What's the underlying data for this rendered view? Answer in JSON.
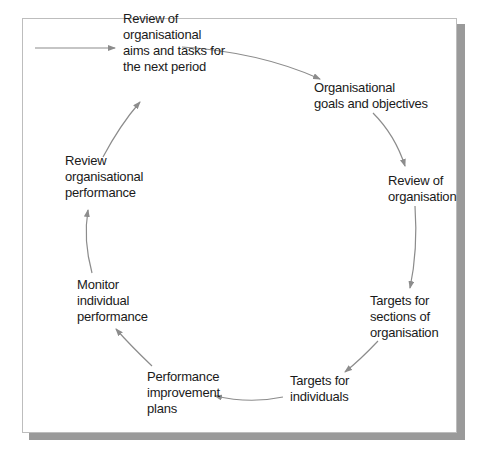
{
  "diagram": {
    "type": "cycle",
    "entry_arrow": true,
    "arrow_color": "#8c8c8c",
    "shadow_color": "#9a9a9a",
    "nodes": [
      {
        "id": "review-aims",
        "lines": [
          "Review of",
          "organisational",
          "aims and tasks for",
          "the next period"
        ]
      },
      {
        "id": "goals-objectives",
        "lines": [
          "Organisational",
          "goals and objectives"
        ]
      },
      {
        "id": "review-organisation",
        "lines": [
          "Review of",
          "organisation"
        ]
      },
      {
        "id": "targets-sections",
        "lines": [
          "Targets for",
          "sections of",
          "organisation"
        ]
      },
      {
        "id": "targets-individuals",
        "lines": [
          "Targets for",
          "individuals"
        ]
      },
      {
        "id": "performance-plans",
        "lines": [
          "Performance",
          "improvement",
          "plans"
        ]
      },
      {
        "id": "monitor-individual",
        "lines": [
          "Monitor",
          "individual",
          "performance"
        ]
      },
      {
        "id": "review-org-performance",
        "lines": [
          "Review",
          "organisational",
          "performance"
        ]
      }
    ],
    "edges": [
      {
        "from": "entry",
        "to": "review-aims"
      },
      {
        "from": "review-aims",
        "to": "goals-objectives"
      },
      {
        "from": "goals-objectives",
        "to": "review-organisation"
      },
      {
        "from": "review-organisation",
        "to": "targets-sections"
      },
      {
        "from": "targets-sections",
        "to": "targets-individuals"
      },
      {
        "from": "targets-individuals",
        "to": "performance-plans"
      },
      {
        "from": "performance-plans",
        "to": "monitor-individual"
      },
      {
        "from": "monitor-individual",
        "to": "review-org-performance"
      },
      {
        "from": "review-org-performance",
        "to": "review-aims"
      }
    ]
  }
}
